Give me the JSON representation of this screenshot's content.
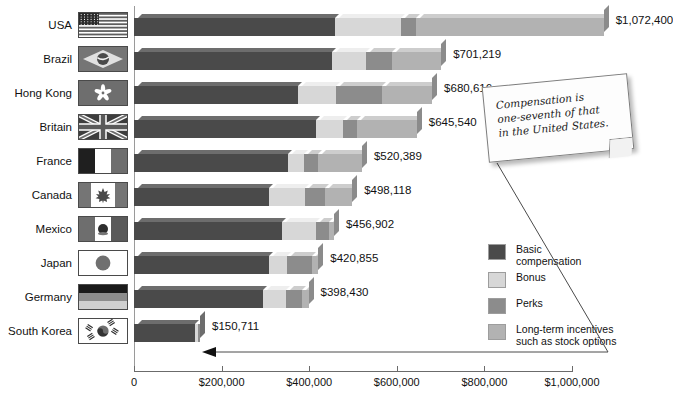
{
  "chart_data": {
    "type": "bar",
    "orientation": "horizontal",
    "stacked": true,
    "title": "",
    "xlabel": "",
    "ylabel": "",
    "xlim": [
      0,
      1000000
    ],
    "grid": false,
    "legend_position": "right",
    "categories": [
      "USA",
      "Brazil",
      "Hong Kong",
      "Britain",
      "France",
      "Canada",
      "Mexico",
      "Japan",
      "Germany",
      "South Korea"
    ],
    "totals": [
      1072400,
      701219,
      680616,
      645540,
      520389,
      498118,
      456902,
      420855,
      398430,
      150711
    ],
    "total_labels": [
      "$1,072,400",
      "$701,219",
      "$680,616",
      "$645,540",
      "$520,389",
      "$498,118",
      "$456,902",
      "$420,855",
      "$398,430",
      "$150,711"
    ],
    "series": [
      {
        "name": "Basic compensation",
        "color": "#4a4a4a",
        "values": [
          460000,
          452000,
          375000,
          415000,
          352000,
          308000,
          338000,
          308000,
          294000,
          139000
        ]
      },
      {
        "name": "Bonus",
        "color": "#d7d7d7",
        "values": [
          150000,
          78000,
          87000,
          62000,
          37000,
          83000,
          77000,
          42000,
          53000,
          7000
        ]
      },
      {
        "name": "Perks",
        "color": "#8c8c8c",
        "values": [
          34000,
          60000,
          105000,
          32000,
          32000,
          45000,
          30000,
          57000,
          36000,
          4711
        ]
      },
      {
        "name": "Long-term incentives such as stock options",
        "color": "#b2b2b2",
        "values": [
          428400,
          111219,
          113616,
          136540,
          99389,
          62118,
          11902,
          13855,
          15430,
          0
        ]
      }
    ],
    "xticks": [
      0,
      200000,
      400000,
      600000,
      800000,
      1000000
    ],
    "xtick_labels": [
      "0",
      "$200,000",
      "$400,000",
      "$600,000",
      "$800,000",
      "$1,000,000"
    ]
  },
  "legend": {
    "items": [
      {
        "label": "Basic\ncompensation",
        "color": "#4a4a4a",
        "swatch_name": "legend-swatch-basic-compensation"
      },
      {
        "label": "Bonus",
        "color": "#d7d7d7",
        "swatch_name": "legend-swatch-bonus"
      },
      {
        "label": "Perks",
        "color": "#8c8c8c",
        "swatch_name": "legend-swatch-perks"
      },
      {
        "label": "Long-term incentives\nsuch as stock options",
        "color": "#b2b2b2",
        "swatch_name": "legend-swatch-long-term-incentives"
      }
    ]
  },
  "callout": {
    "text": "Compensation is\none-seventh of that\nin the United States.",
    "points_to": "South Korea"
  },
  "flags": {
    "USA": "flag-usa",
    "Brazil": "flag-brazil",
    "Hong Kong": "flag-hong-kong",
    "Britain": "flag-britain",
    "France": "flag-france",
    "Canada": "flag-canada",
    "Mexico": "flag-mexico",
    "Japan": "flag-japan",
    "Germany": "flag-germany",
    "South Korea": "flag-south-korea"
  },
  "colors": {
    "basic": "#4a4a4a",
    "bonus": "#d7d7d7",
    "perks": "#8c8c8c",
    "longterm": "#b2b2b2",
    "axis": "#6b6b6b",
    "background": "#ffffff"
  }
}
